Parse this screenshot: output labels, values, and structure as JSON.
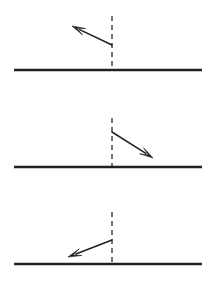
{
  "figure": {
    "type": "diagram",
    "title": "",
    "background_color": "#ffffff",
    "stroke_color": "#231f20",
    "width": 215,
    "height": 308,
    "panel_count": 3,
    "panels": [
      {
        "id": "panel-1",
        "label": "",
        "surface": {
          "x1": 14,
          "y1": 70,
          "x2": 202,
          "y2": 70
        },
        "normal": {
          "x1": 112,
          "y1": 16,
          "x2": 112,
          "y2": 70,
          "dashed": true
        },
        "vector": {
          "name": "arrow-up-left",
          "direction": "up-left",
          "tail_x": 112,
          "tail_y": 45,
          "tip_x": 72,
          "tip_y": 26,
          "angle_deg_from_normal": 64,
          "length_px": 44
        }
      },
      {
        "id": "panel-2",
        "label": "",
        "surface": {
          "x1": 14,
          "y1": 167,
          "x2": 202,
          "y2": 167
        },
        "normal": {
          "x1": 112,
          "y1": 118,
          "x2": 112,
          "y2": 167,
          "dashed": true
        },
        "vector": {
          "name": "arrow-down-right",
          "direction": "down-right",
          "tail_x": 112,
          "tail_y": 132,
          "tip_x": 153,
          "tip_y": 158,
          "angle_deg_from_normal": 58,
          "length_px": 48
        }
      },
      {
        "id": "panel-3",
        "label": "",
        "surface": {
          "x1": 14,
          "y1": 264,
          "x2": 202,
          "y2": 264
        },
        "normal": {
          "x1": 112,
          "y1": 212,
          "x2": 112,
          "y2": 264,
          "dashed": true
        },
        "vector": {
          "name": "arrow-down-left",
          "direction": "down-left",
          "tail_x": 112,
          "tail_y": 240,
          "tip_x": 68,
          "tip_y": 257,
          "angle_deg_from_normal": 69,
          "length_px": 47
        }
      }
    ]
  }
}
